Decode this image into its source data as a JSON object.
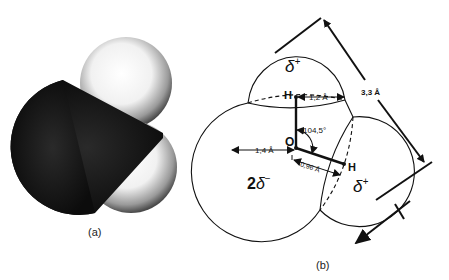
{
  "figure": {
    "panel_a": {
      "caption": "(a)",
      "description": "space-filling model of water molecule",
      "atoms": [
        {
          "name": "O",
          "color": "#1a1a1a"
        },
        {
          "name": "H",
          "color": "#e8e8e8"
        },
        {
          "name": "H",
          "color": "#e8e8e8"
        }
      ]
    },
    "panel_b": {
      "caption": "(b)",
      "atom_labels": {
        "hydrogen_top": "H",
        "oxygen": "O",
        "hydrogen_right": "H"
      },
      "charges": {
        "top_h": "δ+",
        "right_h": "δ+",
        "oxygen": "2δ−"
      },
      "charge_top_symbol": "δ",
      "charge_top_sign": "+",
      "charge_right_symbol": "δ",
      "charge_right_sign": "+",
      "charge_o_coef": "2",
      "charge_o_symbol": "δ",
      "charge_o_sign": "−",
      "dimensions": {
        "h_radius": "1,2 Å",
        "o_radius": "1,4 Å",
        "bond_length": "0,96 Å",
        "bond_angle": "104,5°",
        "molecule_length": "3,3 Å"
      }
    }
  }
}
